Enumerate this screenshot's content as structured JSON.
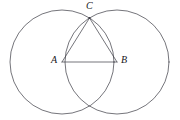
{
  "figure": {
    "kind": "geometry-diagram",
    "width": 180,
    "height": 120,
    "background_color": "#ffffff",
    "stroke_color": "#3a3a42",
    "stroke_width": 0.7,
    "labels": {
      "C": "C",
      "A": "A",
      "B": "B"
    },
    "points": {
      "A": {
        "x": 62,
        "y": 62
      },
      "B": {
        "x": 117,
        "y": 62
      },
      "C": {
        "x": 89.5,
        "y": 18
      },
      "D": {
        "x": 89.5,
        "y": 106
      }
    },
    "circles": [
      {
        "name": "circle-A",
        "cx": 62,
        "cy": 62,
        "r": 52
      },
      {
        "name": "circle-B",
        "cx": 117,
        "cy": 62,
        "r": 52
      }
    ],
    "segments": [
      {
        "name": "segment-AB",
        "from": "A",
        "to": "B"
      },
      {
        "name": "segment-AC",
        "from": "A",
        "to": "C"
      },
      {
        "name": "segment-CB",
        "from": "C",
        "to": "B"
      }
    ]
  }
}
